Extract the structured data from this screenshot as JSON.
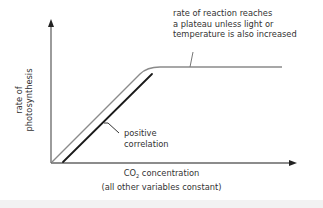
{
  "diagram": {
    "y_axis_label_line1": "rate of",
    "y_axis_label_line2": "photosynthesis",
    "x_axis_label_main": "CO",
    "x_axis_label_sub": "2",
    "x_axis_label_rest": " concentration",
    "x_axis_note": "(all other variables constant)",
    "annotation_plateau": [
      "rate of reaction reaches",
      "a plateau unless light or",
      "temperature is also increased"
    ],
    "annotation_positive": [
      "positive",
      "correlation"
    ],
    "colors": {
      "curve": "#8a8a8a",
      "bracket": "#1a1a1a",
      "axes": "#555555",
      "text": "#333333"
    }
  }
}
